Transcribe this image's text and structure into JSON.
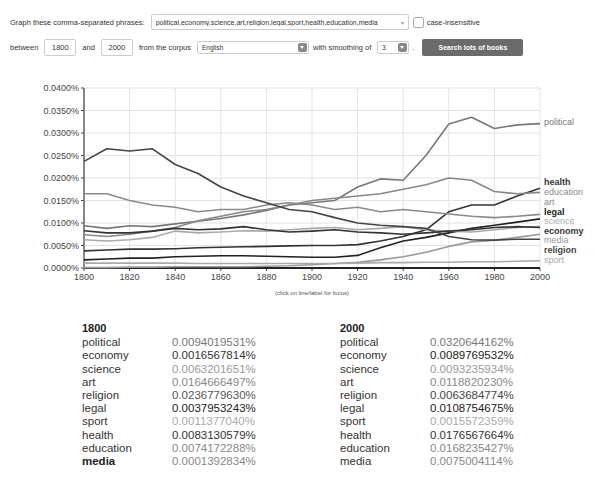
{
  "form": {
    "phrases_label": "Graph these comma-separated phrases:",
    "phrases_value": "political,economy,science,art,religion,legal,sport,health,education,media",
    "case_label": "case-insensitive",
    "between_label": "between",
    "start_year": "1800",
    "and_label": "and",
    "end_year": "2000",
    "corpus_label": "from the corpus",
    "corpus_value": "English",
    "smoothing_label": "with smoothing of",
    "smoothing_value": "3",
    "period": ".",
    "search_button": "Search lots of books"
  },
  "hint": "(click on line/label for focus)",
  "chart_data": {
    "type": "line",
    "title": "",
    "xlabel": "",
    "ylabel": "",
    "xlim": [
      1800,
      2000
    ],
    "ylim": [
      0,
      0.04
    ],
    "grid": true,
    "x_ticks": [
      "1800",
      "1820",
      "1840",
      "1860",
      "1880",
      "1900",
      "1920",
      "1940",
      "1960",
      "1980",
      "2000"
    ],
    "y_ticks": [
      "0.0000%",
      "0.0050%",
      "0.0100%",
      "0.0150%",
      "0.0200%",
      "0.0250%",
      "0.0300%",
      "0.0350%",
      "0.0400%"
    ],
    "legend_placement": "right-end-labels",
    "x": [
      1800,
      1810,
      1820,
      1830,
      1840,
      1850,
      1860,
      1870,
      1880,
      1890,
      1900,
      1910,
      1920,
      1930,
      1940,
      1950,
      1960,
      1970,
      1980,
      1990,
      2000
    ],
    "series": [
      {
        "name": "political",
        "color": "#777777",
        "bold": false,
        "values": [
          0.0094,
          0.0088,
          0.0094,
          0.0092,
          0.0098,
          0.0104,
          0.011,
          0.0118,
          0.0128,
          0.014,
          0.0145,
          0.015,
          0.018,
          0.0198,
          0.0195,
          0.025,
          0.032,
          0.0335,
          0.031,
          0.0318,
          0.0321
        ]
      },
      {
        "name": "health",
        "color": "#333333",
        "bold": true,
        "values": [
          0.0038,
          0.004,
          0.0042,
          0.0042,
          0.0043,
          0.0045,
          0.0046,
          0.0047,
          0.0048,
          0.0049,
          0.005,
          0.005,
          0.0052,
          0.006,
          0.007,
          0.0085,
          0.0125,
          0.014,
          0.014,
          0.016,
          0.0177
        ]
      },
      {
        "name": "education",
        "color": "#888888",
        "bold": false,
        "values": [
          0.0074,
          0.007,
          0.0075,
          0.0082,
          0.009,
          0.0105,
          0.0115,
          0.0125,
          0.013,
          0.014,
          0.015,
          0.0155,
          0.016,
          0.0165,
          0.0175,
          0.0185,
          0.02,
          0.0195,
          0.017,
          0.0165,
          0.0168
        ]
      },
      {
        "name": "art",
        "color": "#8a8a8a",
        "bold": false,
        "values": [
          0.0165,
          0.0165,
          0.015,
          0.014,
          0.0135,
          0.0125,
          0.013,
          0.013,
          0.014,
          0.0145,
          0.014,
          0.013,
          0.0135,
          0.0125,
          0.013,
          0.0125,
          0.012,
          0.0115,
          0.0112,
          0.0115,
          0.0119
        ]
      },
      {
        "name": "legal",
        "color": "#222222",
        "bold": true,
        "values": [
          0.0018,
          0.002,
          0.0022,
          0.0022,
          0.0025,
          0.0026,
          0.0027,
          0.0027,
          0.0026,
          0.0025,
          0.0024,
          0.0024,
          0.0028,
          0.0045,
          0.006,
          0.0068,
          0.0078,
          0.0088,
          0.0095,
          0.0102,
          0.0109
        ]
      },
      {
        "name": "science",
        "color": "#aaaaaa",
        "bold": false,
        "values": [
          0.0063,
          0.006,
          0.0063,
          0.0068,
          0.0082,
          0.0078,
          0.008,
          0.0083,
          0.0082,
          0.0085,
          0.0088,
          0.009,
          0.0085,
          0.0088,
          0.0092,
          0.0085,
          0.0082,
          0.008,
          0.0085,
          0.009,
          0.0093
        ]
      },
      {
        "name": "economy",
        "color": "#333333",
        "bold": true,
        "values": [
          0.0083,
          0.0078,
          0.0078,
          0.0082,
          0.0088,
          0.0085,
          0.0087,
          0.0092,
          0.0085,
          0.008,
          0.0082,
          0.0085,
          0.008,
          0.0078,
          0.0075,
          0.0078,
          0.0082,
          0.0085,
          0.009,
          0.0092,
          0.009
        ]
      },
      {
        "name": "media",
        "color": "#999999",
        "bold": false,
        "values": [
          0.0001,
          0.0001,
          0.0002,
          0.0002,
          0.0003,
          0.0003,
          0.0003,
          0.0003,
          0.0004,
          0.0005,
          0.0007,
          0.001,
          0.0013,
          0.0018,
          0.0025,
          0.0035,
          0.0048,
          0.0058,
          0.0062,
          0.0068,
          0.0075
        ]
      },
      {
        "name": "religion",
        "color": "#444444",
        "bold": true,
        "values": [
          0.0237,
          0.0265,
          0.026,
          0.0265,
          0.023,
          0.021,
          0.018,
          0.016,
          0.0145,
          0.013,
          0.0125,
          0.0112,
          0.01,
          0.0095,
          0.0092,
          0.0088,
          0.007,
          0.0063,
          0.0062,
          0.0064,
          0.0064
        ]
      },
      {
        "name": "sport",
        "color": "#aaaaaa",
        "bold": false,
        "values": [
          0.0011,
          0.0011,
          0.0011,
          0.0011,
          0.0011,
          0.001,
          0.001,
          0.001,
          0.001,
          0.001,
          0.001,
          0.001,
          0.0011,
          0.0012,
          0.0012,
          0.0013,
          0.0013,
          0.0014,
          0.0014,
          0.0015,
          0.0016
        ]
      }
    ]
  },
  "tables": [
    {
      "year": "1800",
      "rows": [
        {
          "name": "political",
          "value": "0.0094019531%",
          "color": "#777777",
          "bold": false
        },
        {
          "name": "economy",
          "value": "0.0016567814%",
          "color": "#333333",
          "bold": false
        },
        {
          "name": "science",
          "value": "0.0063201651%",
          "color": "#999999",
          "bold": false
        },
        {
          "name": "art",
          "value": "0.0164666497%",
          "color": "#888888",
          "bold": false
        },
        {
          "name": "religion",
          "value": "0.0236779630%",
          "color": "#555555",
          "bold": false
        },
        {
          "name": "legal",
          "value": "0.0037953243%",
          "color": "#222222",
          "bold": false
        },
        {
          "name": "sport",
          "value": "0.0011377040%",
          "color": "#aaaaaa",
          "bold": false
        },
        {
          "name": "health",
          "value": "0.0083130579%",
          "color": "#333333",
          "bold": false
        },
        {
          "name": "education",
          "value": "0.0074172288%",
          "color": "#888888",
          "bold": false
        },
        {
          "name": "media",
          "value": "0.0001392834%",
          "color": "#888888",
          "bold": true
        }
      ]
    },
    {
      "year": "2000",
      "rows": [
        {
          "name": "political",
          "value": "0.0320644162%",
          "color": "#777777",
          "bold": false
        },
        {
          "name": "economy",
          "value": "0.0089769532%",
          "color": "#222222",
          "bold": false
        },
        {
          "name": "science",
          "value": "0.0093235934%",
          "color": "#999999",
          "bold": false
        },
        {
          "name": "art",
          "value": "0.0118820230%",
          "color": "#888888",
          "bold": false
        },
        {
          "name": "religion",
          "value": "0.0063684774%",
          "color": "#444444",
          "bold": false
        },
        {
          "name": "legal",
          "value": "0.0108754675%",
          "color": "#222222",
          "bold": false
        },
        {
          "name": "sport",
          "value": "0.0015572359%",
          "color": "#aaaaaa",
          "bold": false
        },
        {
          "name": "health",
          "value": "0.0176567664%",
          "color": "#333333",
          "bold": false
        },
        {
          "name": "education",
          "value": "0.0168235427%",
          "color": "#888888",
          "bold": false
        },
        {
          "name": "media",
          "value": "0.0075004114%",
          "color": "#888888",
          "bold": false
        }
      ]
    }
  ]
}
